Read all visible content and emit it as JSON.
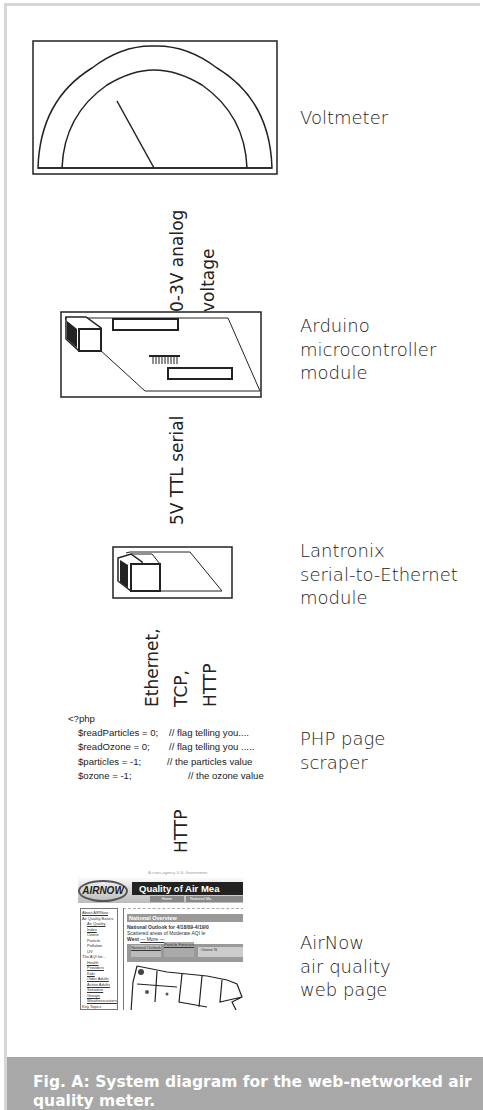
{
  "figure": {
    "caption": "Fig. A: System diagram for the web-networked air quality meter.",
    "colors": {
      "caption_bg": "#a8a8a8",
      "caption_text": "#ffffff",
      "frame_border": "#d6d6d6",
      "line": "#222222"
    }
  },
  "components": [
    {
      "id": "voltmeter",
      "label": "Voltmeter",
      "icon": "voltmeter-icon"
    },
    {
      "id": "arduino",
      "label": "Arduino\nmicrocontroller\nmodule",
      "icon": "circuit-board-icon"
    },
    {
      "id": "lantronix",
      "label": "Lantronix\nserial-to-Ethernet\nmodule",
      "icon": "ethernet-module-icon"
    },
    {
      "id": "php",
      "label": "PHP page\nscraper",
      "icon": "code-snippet"
    },
    {
      "id": "airnow",
      "label": "AirNow\nair quality\nweb page",
      "icon": "webpage-screenshot"
    }
  ],
  "connections": [
    {
      "from": "voltmeter",
      "to": "arduino",
      "label": "0-3V analog\nvoltage"
    },
    {
      "from": "arduino",
      "to": "lantronix",
      "label": "5V TTL serial"
    },
    {
      "from": "lantronix",
      "to": "php",
      "label": "Ethernet,\nTCP,\nHTTP"
    },
    {
      "from": "php",
      "to": "airnow",
      "label": "HTTP"
    }
  ],
  "php_code": {
    "open_tag": "<?php",
    "lines": [
      {
        "code": "$readParticles = 0;",
        "comment": "// flag telling you...."
      },
      {
        "code": "$readOzone = 0;",
        "comment": "// flag telling you ....."
      },
      {
        "code": "$particles = -1;",
        "comment": "// the particles value"
      },
      {
        "code": "$ozone = -1;",
        "comment": "// the ozone value"
      }
    ]
  },
  "airnow_page": {
    "tagline": "A cross-agency U.S. Government",
    "logo": "AIRNOW",
    "banner": "Quality of Air Mea",
    "nav": [
      "Home",
      "National Ma"
    ],
    "sidebar": [
      "About AIRNow",
      "Air Quality Basics",
      "Air Quality Index",
      "Ozone",
      "Particle Pollution",
      "UV",
      "The AQI for...",
      "Health Providers",
      "Kids",
      "Older Adults",
      "Active Adults",
      "Sensitive Groups",
      "Weatherscasters",
      "Key Topics"
    ],
    "section_title": "National Overview",
    "headline": "National Outlook for 4/18/09-4/19/0",
    "body": "Scattered areas of Moderate AQI le",
    "body2": "West",
    "more": "— More —",
    "tabs": [
      "National Outlook",
      "Particle Forecast",
      "Ozone N"
    ]
  }
}
